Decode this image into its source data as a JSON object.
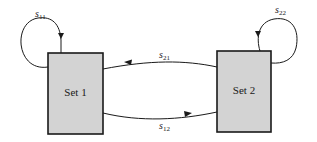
{
  "diagram": {
    "nodes": [
      {
        "id": "set1",
        "label": "Set 1"
      },
      {
        "id": "set2",
        "label": "Set 2"
      }
    ],
    "edges": [
      {
        "from": "set1",
        "to": "set1",
        "symbol": "s",
        "subscript": "11"
      },
      {
        "from": "set2",
        "to": "set2",
        "symbol": "s",
        "subscript": "22"
      },
      {
        "from": "set2",
        "to": "set1",
        "symbol": "s",
        "subscript": "21"
      },
      {
        "from": "set1",
        "to": "set2",
        "symbol": "s",
        "subscript": "12"
      }
    ],
    "colors": {
      "box_fill": "#d3d3d3",
      "stroke": "#1a1a1a"
    }
  }
}
